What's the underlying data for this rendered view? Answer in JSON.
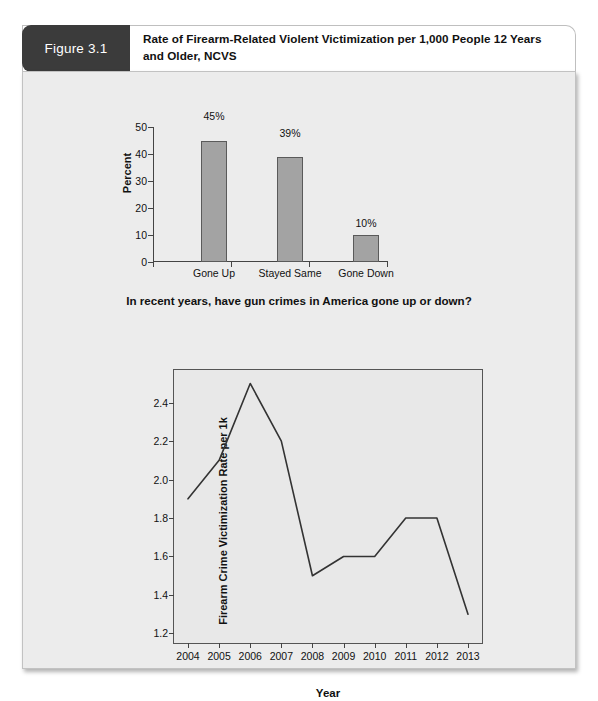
{
  "figure": {
    "badge_label": "Figure 3.1",
    "title": "Rate of Firearm-Related Violent Victimization per 1,000 People 12 Years and Older, NCVS"
  },
  "colors": {
    "badge_bg": "#3b3b3b",
    "panel_bg": "#ececec",
    "plot_bg": "#e8e8e8",
    "bar_fill": "#a3a3a3",
    "bar_stroke": "#5a5a5a",
    "line_stroke": "#333333",
    "axis": "#444444"
  },
  "chart_data": [
    {
      "type": "bar",
      "title": "",
      "categories": [
        "Gone Up",
        "Stayed Same",
        "Gone Down"
      ],
      "values": [
        45,
        39,
        10
      ],
      "value_labels": [
        "45%",
        "39%",
        "10%"
      ],
      "xlabel": "In recent years, have gun crimes in America gone up or down?",
      "ylabel": "Percent",
      "ylim": [
        0,
        50
      ],
      "yticks": [
        0,
        10,
        20,
        30,
        40,
        50
      ],
      "ytick_labels": [
        "0",
        "10",
        "20",
        "30",
        "40",
        "50"
      ],
      "grid": false,
      "legend": "none"
    },
    {
      "type": "line",
      "title": "",
      "x": [
        "2004",
        "2005",
        "2006",
        "2007",
        "2008",
        "2009",
        "2010",
        "2011",
        "2012",
        "2013"
      ],
      "values": [
        1.9,
        2.1,
        2.5,
        2.2,
        1.5,
        1.6,
        1.6,
        1.8,
        1.8,
        1.3
      ],
      "xlabel": "Year",
      "ylabel": "Firearm Crime Victimization Rate per 1k",
      "ylim": [
        1.15,
        2.57
      ],
      "yticks": [
        1.2,
        1.4,
        1.6,
        1.8,
        2.0,
        2.2,
        2.4
      ],
      "ytick_labels": [
        "1.2",
        "1.4",
        "1.6",
        "1.8",
        "2.0",
        "2.2",
        "2.4"
      ],
      "grid": false,
      "legend": "none"
    }
  ]
}
